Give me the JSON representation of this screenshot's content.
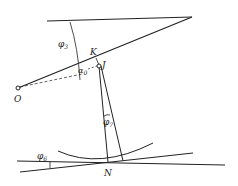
{
  "diagram": {
    "type": "geometric-mechanism",
    "stroke_color": "#222222",
    "background": "#ffffff",
    "points": {
      "O": {
        "label": "O"
      },
      "K": {
        "label": "K"
      },
      "J": {
        "label": "J"
      },
      "N": {
        "label": "N"
      }
    },
    "angles": {
      "phi3": {
        "symbol": "φ",
        "sub": "3"
      },
      "alpha0": {
        "symbol": "α",
        "sub": "0"
      },
      "phi7": {
        "symbol": "φ",
        "sub": "7"
      },
      "phi6": {
        "symbol": "φ",
        "sub": "6"
      }
    }
  }
}
